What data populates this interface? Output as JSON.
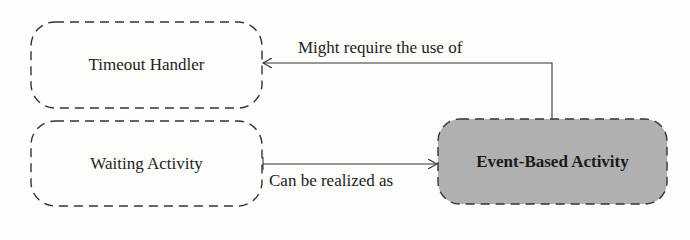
{
  "diagram": {
    "nodes": [
      {
        "id": "timeout_handler",
        "label": "Timeout Handler",
        "style": "dashed",
        "fill": "#fdfdfb"
      },
      {
        "id": "waiting_activity",
        "label": "Waiting Activity",
        "style": "dashed",
        "fill": "#fdfdfb"
      },
      {
        "id": "event_based_activity",
        "label": "Event-Based Activity",
        "style": "dashed",
        "fill": "#b0b0b0",
        "bold": true
      }
    ],
    "edges": [
      {
        "from": "event_based_activity",
        "to": "timeout_handler",
        "label": "Might require the use of"
      },
      {
        "from": "waiting_activity",
        "to": "event_based_activity",
        "label": "Can be realized as"
      }
    ]
  },
  "colors": {
    "stroke": "#333333",
    "highlight_fill": "#b0b0b0",
    "background": "#fdfdfb"
  }
}
